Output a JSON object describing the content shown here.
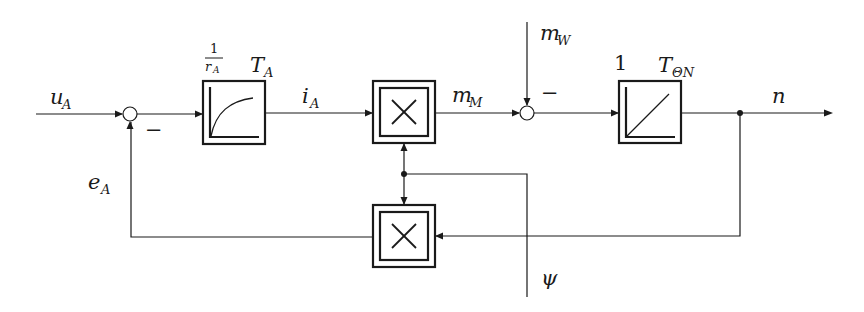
{
  "diagram": {
    "type": "block-diagram",
    "signals": {
      "input": "u",
      "input_sub": "A",
      "current": "i",
      "current_sub": "A",
      "motor_torque": "m",
      "motor_torque_sub": "M",
      "load_torque": "m",
      "load_torque_sub": "W",
      "output": "n",
      "back_emf": "e",
      "back_emf_sub": "A",
      "flux": "ψ"
    },
    "blocks": [
      {
        "id": "armature",
        "kind": "PT1",
        "gain_numerator": "1",
        "gain_denominator": "r",
        "gain_denominator_sub": "A",
        "time_constant": "T",
        "time_constant_sub": "A"
      },
      {
        "id": "multiplier-torque",
        "kind": "multiplier",
        "symbol": "×"
      },
      {
        "id": "integrator",
        "kind": "I",
        "gain": "1",
        "time_constant": "T",
        "time_constant_sub": "ΘN"
      },
      {
        "id": "multiplier-emf",
        "kind": "multiplier",
        "symbol": "×"
      }
    ],
    "summing_junctions": [
      {
        "id": "sum-voltage",
        "sign_label": "−"
      },
      {
        "id": "sum-torque",
        "sign_label": "−"
      }
    ]
  }
}
